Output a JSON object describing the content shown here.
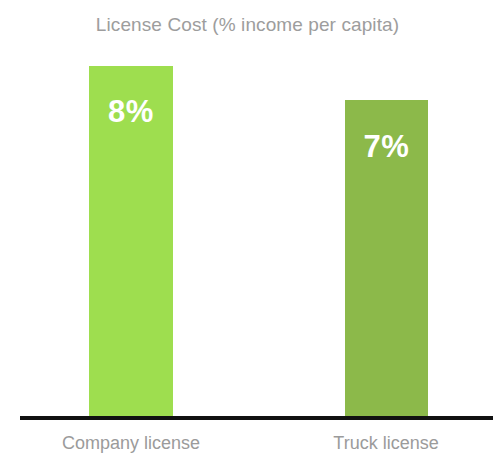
{
  "chart_data": {
    "type": "bar",
    "title": "License Cost (% income per capita)",
    "xlabel": "",
    "ylabel": "",
    "categories": [
      "Company license",
      "Truck license"
    ],
    "values": [
      8,
      7
    ],
    "value_labels": [
      "8%",
      "7%"
    ],
    "value_unit": "%",
    "grid": false,
    "legend": null,
    "axis": {
      "baseline_visible": true,
      "y_axis_visible": false,
      "y_ticks": []
    },
    "series": [
      {
        "name": "License Cost (% income per capita)",
        "values": [
          8,
          7
        ],
        "points": [
          {
            "category": "Company license",
            "value": 8,
            "label": "8%",
            "color": "#9ede4f",
            "bar_height_px": 352
          },
          {
            "category": "Truck license",
            "value": 7,
            "label": "7%",
            "color": "#8cb94a",
            "bar_height_px": 318
          }
        ]
      }
    ]
  },
  "colors": {
    "background": "#ffffff",
    "title_text": "#9d9d9d",
    "category_text": "#9b9b9b",
    "value_text": "#ffffff",
    "baseline": "#111111",
    "bar_company_license": "#9ede4f",
    "bar_truck_license": "#8cb94a"
  }
}
